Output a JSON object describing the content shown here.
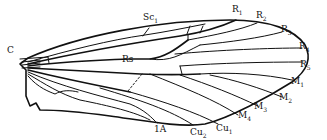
{
  "figure": {
    "labels": [
      {
        "id": "C",
        "text": "C",
        "x": 7,
        "y": 46
      },
      {
        "id": "Sc1",
        "text": "Sc1",
        "x": 143,
        "y": 13
      },
      {
        "id": "R1",
        "text": "R1",
        "x": 232,
        "y": 5
      },
      {
        "id": "R2",
        "text": "R2",
        "x": 256,
        "y": 11
      },
      {
        "id": "R3",
        "text": "R3",
        "x": 281,
        "y": 25
      },
      {
        "id": "R4",
        "text": "R4",
        "x": 299,
        "y": 42
      },
      {
        "id": "R5",
        "text": "R5",
        "x": 300,
        "y": 60
      },
      {
        "id": "Rs",
        "text": "Rs",
        "x": 122,
        "y": 55
      },
      {
        "id": "M1",
        "text": "M1",
        "x": 291,
        "y": 77
      },
      {
        "id": "M2",
        "text": "M2",
        "x": 279,
        "y": 93
      },
      {
        "id": "M3",
        "text": "M3",
        "x": 254,
        "y": 102
      },
      {
        "id": "M4",
        "text": "M4",
        "x": 238,
        "y": 111
      },
      {
        "id": "Cu1",
        "text": "Cu1",
        "x": 216,
        "y": 124
      },
      {
        "id": "Cu2",
        "text": "Cu2",
        "x": 190,
        "y": 128
      },
      {
        "id": "1A",
        "text": "1A",
        "x": 154,
        "y": 125
      }
    ]
  }
}
